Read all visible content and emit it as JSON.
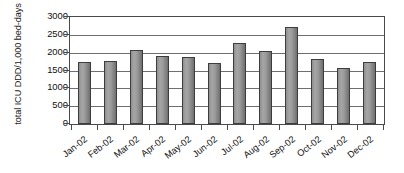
{
  "chart_data": {
    "type": "bar",
    "title": "",
    "xlabel": "",
    "ylabel": "total ICU DDD/1,000 bed-days",
    "ylim": [
      0,
      3000
    ],
    "ytick_step": 500,
    "grid": true,
    "legend": "none",
    "bar_color": "#9a9a9a",
    "bar_edge_color": "#3d3d3d",
    "axis_color": "#4a4a4a",
    "categories": [
      "Jan-02",
      "Feb-02",
      "Mar-02",
      "Apr-02",
      "May-02",
      "Jun-02",
      "Jul-02",
      "Aug-02",
      "Sep-02",
      "Oct-02",
      "Nov-02",
      "Dec-02"
    ],
    "values": [
      1740,
      1765,
      2085,
      1905,
      1880,
      1720,
      2280,
      2050,
      2720,
      1820,
      1570,
      1740
    ],
    "ytick_labels": [
      "3000",
      "2500",
      "2000",
      "1500",
      "1000",
      "500",
      "0"
    ],
    "ytick_values": [
      3000,
      2500,
      2000,
      1500,
      1000,
      500,
      0
    ]
  }
}
